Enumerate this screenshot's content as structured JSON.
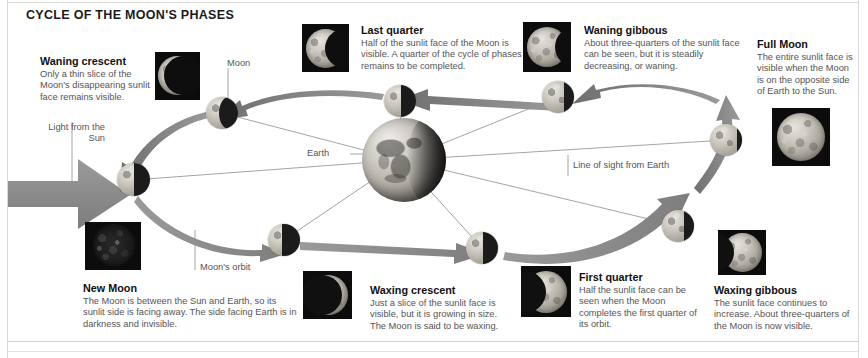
{
  "diagram": {
    "title": "CYCLE OF THE MOON'S PHASES"
  },
  "annotations": {
    "moon": "Moon",
    "earth": "Earth",
    "light_from_sun_line1": "Light from the",
    "light_from_sun_line2": "Sun",
    "moons_orbit": "Moon's orbit",
    "line_of_sight": "Line of sight from Earth"
  },
  "phases": [
    {
      "id": "waning-crescent",
      "heading": "Waning crescent",
      "body": "Only a thin slice of the Moon's disappearing sunlit face remains visible."
    },
    {
      "id": "last-quarter",
      "heading": "Last quarter",
      "body": "Half of the sunlit face of the Moon is visible. A quarter of the cycle of phases remains to be completed."
    },
    {
      "id": "waning-gibbous",
      "heading": "Waning gibbous",
      "body": "About three-quarters of the sunlit face can be seen, but it is steadily decreasing, or waning."
    },
    {
      "id": "full-moon",
      "heading": "Full Moon",
      "body": "The entire sunlit face is visible when the Moon is on the opposite side of Earth to the Sun."
    },
    {
      "id": "new-moon",
      "heading": "New Moon",
      "body": "The Moon is between the Sun and Earth, so its sunlit side is facing away. The side facing Earth is in darkness and invisible."
    },
    {
      "id": "waxing-crescent",
      "heading": "Waxing crescent",
      "body": "Just a slice of the sunlit face is visible, but it is growing in size. The Moon is said to be waxing."
    },
    {
      "id": "first-quarter",
      "heading": "First quarter",
      "body": "Half the sunlit face can be seen when the Moon completes the first quarter of its orbit."
    },
    {
      "id": "waxing-gibbous",
      "heading": "Waxing gibbous",
      "body": "The sunlit face continues to increase. About three-quarters of the Moon is now visible."
    }
  ],
  "colors": {
    "page_background": "#ffffff",
    "heading_text": "#111111",
    "body_text": "#555555",
    "arrow_gray": "#8a8a8a",
    "photo_frame": "#0c0c0c",
    "sight_line": "#8c8c8c"
  }
}
